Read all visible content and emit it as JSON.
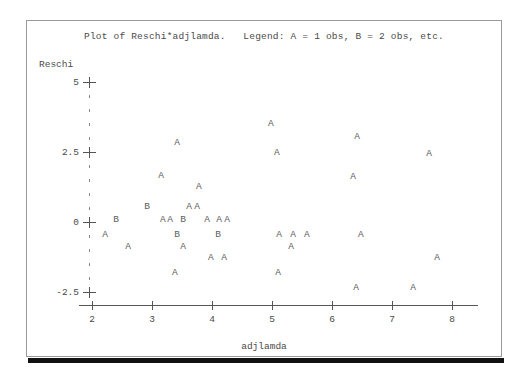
{
  "plot": {
    "title": "Plot of Reschi*adjlamda.   Legend: A = 1 obs, B = 2 obs, etc.",
    "x_axis_title": "adjlamda",
    "y_axis_title": "Reschi",
    "frame_color": "#9a9a9a",
    "axis_color": "#555555",
    "text_color": "#4a4a4a",
    "glyph_color": "#5d5d5d",
    "background": "#ffffff"
  },
  "chart_data": {
    "type": "scatter",
    "title": "Plot of Reschi*adjlamda.   Legend: A = 1 obs, B = 2 obs, etc.",
    "xlabel": "adjlamda",
    "ylabel": "Reschi",
    "xlim": [
      1.85,
      8.3
    ],
    "ylim": [
      -2.95,
      5.3
    ],
    "xticks": [
      2,
      3,
      4,
      5,
      6,
      7,
      8
    ],
    "xtick_labels": [
      "2",
      "3",
      "4",
      "5",
      "6",
      "7",
      "8"
    ],
    "yticks": [
      5,
      2.5,
      0,
      -2.5
    ],
    "ytick_labels": [
      "5",
      "2.5",
      "0",
      "-2.5"
    ],
    "y_minor_count_per_interval": 4,
    "grid": false,
    "legend": "A = 1 obs, B = 2 obs, etc.",
    "legend_position": "in-title",
    "marker_encoding": {
      "A": 1,
      "B": 2
    },
    "points": [
      {
        "x": 4.98,
        "y": 3.5,
        "marker": "A",
        "count": 1
      },
      {
        "x": 6.42,
        "y": 3.05,
        "marker": "A",
        "count": 1
      },
      {
        "x": 3.42,
        "y": 2.82,
        "marker": "A",
        "count": 1
      },
      {
        "x": 5.08,
        "y": 2.46,
        "marker": "A",
        "count": 1
      },
      {
        "x": 7.62,
        "y": 2.42,
        "marker": "A",
        "count": 1
      },
      {
        "x": 3.15,
        "y": 1.66,
        "marker": "A",
        "count": 1
      },
      {
        "x": 6.35,
        "y": 1.62,
        "marker": "A",
        "count": 1
      },
      {
        "x": 3.78,
        "y": 1.25,
        "marker": "A",
        "count": 1
      },
      {
        "x": 2.92,
        "y": 0.54,
        "marker": "B",
        "count": 2
      },
      {
        "x": 3.62,
        "y": 0.54,
        "marker": "A",
        "count": 1
      },
      {
        "x": 3.75,
        "y": 0.54,
        "marker": "A",
        "count": 1
      },
      {
        "x": 2.4,
        "y": 0.06,
        "marker": "B",
        "count": 2
      },
      {
        "x": 3.18,
        "y": 0.06,
        "marker": "A",
        "count": 1
      },
      {
        "x": 3.3,
        "y": 0.06,
        "marker": "A",
        "count": 1
      },
      {
        "x": 3.52,
        "y": 0.06,
        "marker": "B",
        "count": 2
      },
      {
        "x": 3.92,
        "y": 0.06,
        "marker": "A",
        "count": 1
      },
      {
        "x": 4.12,
        "y": 0.06,
        "marker": "A",
        "count": 1
      },
      {
        "x": 4.25,
        "y": 0.06,
        "marker": "A",
        "count": 1
      },
      {
        "x": 2.22,
        "y": -0.48,
        "marker": "A",
        "count": 1
      },
      {
        "x": 3.42,
        "y": -0.48,
        "marker": "B",
        "count": 2
      },
      {
        "x": 4.1,
        "y": -0.48,
        "marker": "B",
        "count": 2
      },
      {
        "x": 5.12,
        "y": -0.48,
        "marker": "A",
        "count": 1
      },
      {
        "x": 5.35,
        "y": -0.48,
        "marker": "A",
        "count": 1
      },
      {
        "x": 5.58,
        "y": -0.48,
        "marker": "A",
        "count": 1
      },
      {
        "x": 6.48,
        "y": -0.48,
        "marker": "A",
        "count": 1
      },
      {
        "x": 2.6,
        "y": -0.88,
        "marker": "A",
        "count": 1
      },
      {
        "x": 3.52,
        "y": -0.88,
        "marker": "A",
        "count": 1
      },
      {
        "x": 5.32,
        "y": -0.88,
        "marker": "A",
        "count": 1
      },
      {
        "x": 3.98,
        "y": -1.3,
        "marker": "A",
        "count": 1
      },
      {
        "x": 4.2,
        "y": -1.3,
        "marker": "A",
        "count": 1
      },
      {
        "x": 7.75,
        "y": -1.3,
        "marker": "A",
        "count": 1
      },
      {
        "x": 3.38,
        "y": -1.82,
        "marker": "A",
        "count": 1
      },
      {
        "x": 5.1,
        "y": -1.82,
        "marker": "A",
        "count": 1
      },
      {
        "x": 6.4,
        "y": -2.35,
        "marker": "A",
        "count": 1
      },
      {
        "x": 7.35,
        "y": -2.35,
        "marker": "A",
        "count": 1
      }
    ]
  }
}
